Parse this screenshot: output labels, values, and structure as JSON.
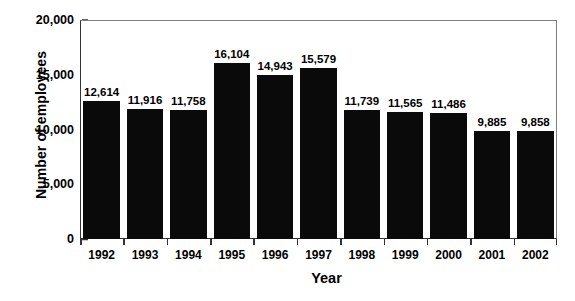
{
  "chart_data": {
    "type": "bar",
    "title": "",
    "xlabel": "Year",
    "ylabel": "Number of employees",
    "categories": [
      "1992",
      "1993",
      "1994",
      "1995",
      "1996",
      "1997",
      "1998",
      "1999",
      "2000",
      "2001",
      "2002"
    ],
    "values": [
      12614,
      11916,
      11758,
      16104,
      14943,
      15579,
      11739,
      11565,
      11486,
      9885,
      9858
    ],
    "value_labels": [
      "12,614",
      "11,916",
      "11,758",
      "16,104",
      "14,943",
      "15,579",
      "11,739",
      "11,565",
      "11,486",
      "9,885",
      "9,858"
    ],
    "ylim": [
      0,
      20000
    ],
    "yticks": [
      0,
      5000,
      10000,
      15000,
      20000
    ],
    "ytick_labels": [
      "0",
      "5,000",
      "10,000",
      "15,000",
      "20,000"
    ],
    "grid": false,
    "legend": false,
    "bar_color": "#0a0a0a",
    "axis_color": "#333333",
    "background": "#ffffff"
  }
}
